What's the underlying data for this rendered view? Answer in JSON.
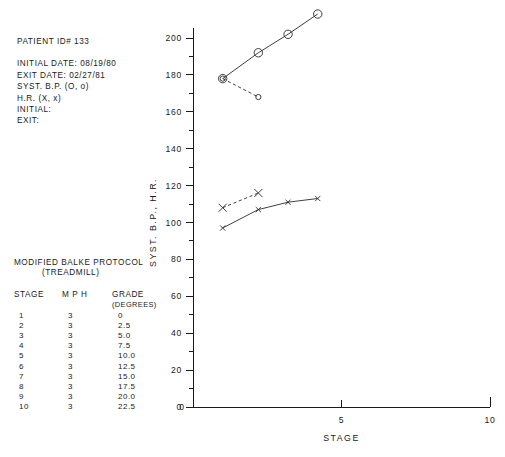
{
  "patient": {
    "id_line": "PATIENT ID# 133",
    "lines": [
      "INITIAL DATE: 08/19/80",
      "EXIT DATE: 02/27/81",
      "SYST. B.P. (O, o)",
      "H.R. (X, x)",
      "INITIAL:",
      "EXIT:"
    ]
  },
  "protocol": {
    "title": "MODIFIED BALKE PROTOCOL",
    "subtitle": "(TREADMILL)",
    "columns": [
      "STAGE",
      "M P H",
      "GRADE"
    ],
    "grade_unit": "(DEGREES)",
    "rows": [
      [
        "1",
        "3",
        "0"
      ],
      [
        "2",
        "3",
        "2.5"
      ],
      [
        "3",
        "3",
        "5.0"
      ],
      [
        "4",
        "3",
        "7.5"
      ],
      [
        "5",
        "3",
        "10.0"
      ],
      [
        "6",
        "3",
        "12.5"
      ],
      [
        "7",
        "3",
        "15.0"
      ],
      [
        "8",
        "3",
        "17.5"
      ],
      [
        "9",
        "3",
        "20.0"
      ],
      [
        "10",
        "3",
        "22.5"
      ]
    ]
  },
  "chart_data": {
    "type": "line",
    "title": "",
    "xlabel": "STAGE",
    "ylabel": "SYST. B.P., H.R.",
    "xlim": [
      0,
      10
    ],
    "ylim": [
      0,
      200
    ],
    "xticks": [
      0,
      5,
      10
    ],
    "xticklabels": [
      "0",
      "5",
      "10"
    ],
    "yticks": [
      0,
      20,
      40,
      60,
      80,
      100,
      120,
      140,
      160,
      180,
      200
    ],
    "yticklabels": [
      "0",
      "20",
      "40",
      "60",
      "80",
      "100",
      "120",
      "140",
      "160",
      "180",
      "200"
    ],
    "yminorticks": [
      10,
      30,
      50,
      70,
      90,
      110,
      130,
      150,
      170,
      190
    ],
    "grid": false,
    "legend": "none",
    "series": [
      {
        "name": "SYST. B.P. INITIAL (O)",
        "marker": "O",
        "marker_size": "large",
        "linestyle": "solid",
        "x": [
          1.0,
          2.2,
          3.2,
          4.2
        ],
        "y": [
          178,
          192,
          202,
          213
        ]
      },
      {
        "name": "SYST. B.P. EXIT (o)",
        "marker": "o",
        "marker_size": "small",
        "linestyle": "dashed",
        "x": [
          1.0,
          2.2
        ],
        "y": [
          178,
          168
        ]
      },
      {
        "name": "H.R. INITIAL (X)",
        "marker": "X",
        "marker_size": "large",
        "linestyle": "dashed",
        "x": [
          1.0,
          2.2
        ],
        "y": [
          108,
          116
        ]
      },
      {
        "name": "H.R. EXIT (x)",
        "marker": "x",
        "marker_size": "small",
        "linestyle": "solid",
        "x": [
          1.0,
          2.2,
          3.2,
          4.2
        ],
        "y": [
          97,
          107,
          111,
          113
        ]
      }
    ]
  }
}
